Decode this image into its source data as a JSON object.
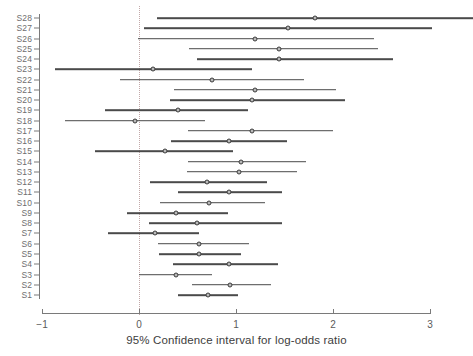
{
  "chart_data": {
    "type": "scatter",
    "subtype": "forest-plot",
    "title": "",
    "xlabel": "95% Confidence interval for log-odds ratio",
    "ylabel": "",
    "xlim": [
      -1,
      3
    ],
    "xticks": [
      -1,
      0,
      1,
      2,
      3
    ],
    "xtick_labels": [
      "−1",
      "0",
      "1",
      "2",
      "3"
    ],
    "grid": false,
    "legend": null,
    "reference_line": {
      "x": 0,
      "style": "dotted",
      "color": "#c2a8a8"
    },
    "categories": [
      "S28",
      "S27",
      "S26",
      "S25",
      "S24",
      "S23",
      "S22",
      "S21",
      "S20",
      "S19",
      "S18",
      "S17",
      "S16",
      "S15",
      "S14",
      "S13",
      "S12",
      "S11",
      "S10",
      "S9",
      "S8",
      "S7",
      "S6",
      "S5",
      "S4",
      "S3",
      "S2",
      "S1"
    ],
    "point_color": "#3c3c3c",
    "line_color": "#4a4a4a",
    "series": [
      {
        "name": "95% Confidence interval for log-odds ratio",
        "points": [
          {
            "label": "S28",
            "estimate": 1.81,
            "lower": 0.19,
            "upper": 3.45
          },
          {
            "label": "S27",
            "estimate": 1.54,
            "lower": 0.05,
            "upper": 3.02
          },
          {
            "label": "S26",
            "estimate": 1.2,
            "lower": -0.01,
            "upper": 2.42
          },
          {
            "label": "S25",
            "estimate": 1.44,
            "lower": 0.52,
            "upper": 2.46
          },
          {
            "label": "S24",
            "estimate": 1.44,
            "lower": 0.6,
            "upper": 2.62
          },
          {
            "label": "S23",
            "estimate": 0.14,
            "lower": -0.87,
            "upper": 1.16
          },
          {
            "label": "S22",
            "estimate": 0.75,
            "lower": -0.2,
            "upper": 1.7
          },
          {
            "label": "S21",
            "estimate": 1.2,
            "lower": 0.36,
            "upper": 2.03
          },
          {
            "label": "S20",
            "estimate": 1.17,
            "lower": 0.32,
            "upper": 2.12
          },
          {
            "label": "S19",
            "estimate": 0.4,
            "lower": -0.35,
            "upper": 1.12
          },
          {
            "label": "S18",
            "estimate": -0.04,
            "lower": -0.76,
            "upper": 0.68
          },
          {
            "label": "S17",
            "estimate": 1.16,
            "lower": 0.51,
            "upper": 2.0
          },
          {
            "label": "S16",
            "estimate": 0.93,
            "lower": 0.33,
            "upper": 1.53
          },
          {
            "label": "S15",
            "estimate": 0.27,
            "lower": -0.45,
            "upper": 0.97
          },
          {
            "label": "S14",
            "estimate": 1.05,
            "lower": 0.5,
            "upper": 1.72
          },
          {
            "label": "S13",
            "estimate": 1.03,
            "lower": 0.49,
            "upper": 1.63
          },
          {
            "label": "S12",
            "estimate": 0.7,
            "lower": 0.11,
            "upper": 1.32
          },
          {
            "label": "S11",
            "estimate": 0.93,
            "lower": 0.4,
            "upper": 1.47
          },
          {
            "label": "S10",
            "estimate": 0.72,
            "lower": 0.22,
            "upper": 1.3
          },
          {
            "label": "S9",
            "estimate": 0.38,
            "lower": -0.12,
            "upper": 0.92
          },
          {
            "label": "S8",
            "estimate": 0.6,
            "lower": 0.1,
            "upper": 1.47
          },
          {
            "label": "S7",
            "estimate": 0.16,
            "lower": -0.32,
            "upper": 0.62
          },
          {
            "label": "S6",
            "estimate": 0.62,
            "lower": 0.2,
            "upper": 1.13
          },
          {
            "label": "S5",
            "estimate": 0.62,
            "lower": 0.21,
            "upper": 1.05
          },
          {
            "label": "S4",
            "estimate": 0.93,
            "lower": 0.35,
            "upper": 1.43
          },
          {
            "label": "S3",
            "estimate": 0.38,
            "lower": 0.0,
            "upper": 0.75
          },
          {
            "label": "S2",
            "estimate": 0.94,
            "lower": 0.55,
            "upper": 1.36
          },
          {
            "label": "S1",
            "estimate": 0.71,
            "lower": 0.4,
            "upper": 1.02
          }
        ]
      }
    ]
  },
  "axes": {
    "x_title": "95% Confidence interval for log-odds ratio"
  }
}
